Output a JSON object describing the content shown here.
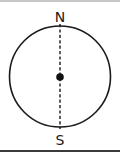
{
  "diagram": {
    "type": "compass-circle",
    "labels": {
      "north": "N",
      "south": "S"
    },
    "colors": {
      "stroke": "#1a1a1a",
      "background": "#ffffff",
      "top_rule": "#c8c8c8",
      "bottom_rule": "#3a3a3a"
    },
    "elements": [
      {
        "name": "circle",
        "shape": "circle",
        "style": "solid outline"
      },
      {
        "name": "axis",
        "shape": "line",
        "style": "dashed vertical",
        "from": "N",
        "to": "S"
      },
      {
        "name": "center-point",
        "shape": "dot",
        "style": "filled"
      }
    ]
  }
}
